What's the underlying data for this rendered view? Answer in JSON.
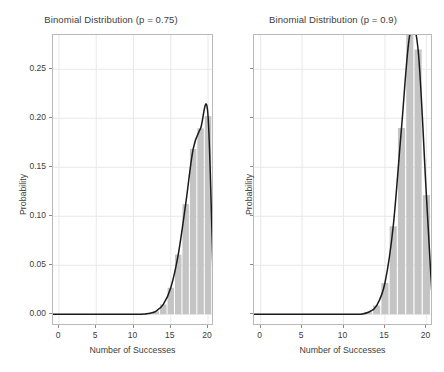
{
  "figure": {
    "width": 444,
    "height": 372,
    "background": "#ffffff",
    "bar_color": "#c4c4c4",
    "curve_color": "#1a1a1a",
    "grid_color": "#e8e8e8",
    "axis_color": "#b9b9b9",
    "text_color": "#3c3c3c"
  },
  "chart_data": [
    {
      "type": "bar",
      "title": "Binomial Distribution (p = 0.75)",
      "xlabel": "Number of Successes",
      "ylabel": "Probability",
      "xlim": [
        -0.8,
        20.8
      ],
      "ylim": [
        -0.012,
        0.285
      ],
      "grid": true,
      "legend": "none",
      "xticks": [
        0,
        5,
        10,
        15,
        20
      ],
      "xtick_labels": [
        "0",
        "5",
        "10",
        "15",
        "20"
      ],
      "yticks": [
        0.0,
        0.05,
        0.1,
        0.15,
        0.2,
        0.25
      ],
      "ytick_labels": [
        "0.00",
        "0.05",
        "0.10",
        "0.15",
        "0.20",
        "0.25"
      ],
      "categories": [
        0,
        1,
        2,
        3,
        4,
        5,
        6,
        7,
        8,
        9,
        10,
        11,
        12,
        13,
        14,
        15,
        16,
        17,
        18,
        19,
        20
      ],
      "values": [
        0.0,
        0.0,
        0.0,
        0.0,
        0.0,
        0.0,
        0.0,
        0.0,
        0.0,
        0.0,
        0.0,
        0.001,
        0.003,
        0.01,
        0.027,
        0.06,
        0.112,
        0.169,
        0.19,
        0.152,
        0.067,
        0.003
      ],
      "series": [
        {
          "name": "binomial pmf (n = 20, p = 0.75)",
          "values": [
            0.0,
            0.0,
            0.0,
            0.0,
            0.0,
            0.0,
            0.0,
            0.0,
            0.0,
            0.0,
            0.0,
            0.0,
            0.0008,
            0.003,
            0.01,
            0.0271,
            0.0609,
            0.1124,
            0.1686,
            0.1897,
            0.2023,
            0.1339,
            0.0317
          ],
          "color": "#c4c4c4",
          "kind": "bars"
        },
        {
          "name": "smoothed density curve",
          "color": "#1a1a1a",
          "kind": "line"
        }
      ],
      "peak": {
        "x": 15,
        "y": 0.2023
      }
    },
    {
      "type": "bar",
      "title": "Binomial Distribution (p = 0.9)",
      "xlabel": "Number of Successes",
      "ylabel": "Probability",
      "xlim": [
        -0.8,
        20.8
      ],
      "ylim": [
        -0.012,
        0.285
      ],
      "grid": true,
      "legend": "none",
      "xticks": [
        0,
        5,
        10,
        15,
        20
      ],
      "xtick_labels": [
        "0",
        "5",
        "10",
        "15",
        "20"
      ],
      "yticks": [
        0.0,
        0.05,
        0.1,
        0.15,
        0.2,
        0.25
      ],
      "ytick_labels": [
        "",
        "",
        "",
        "",
        "",
        ""
      ],
      "categories": [
        0,
        1,
        2,
        3,
        4,
        5,
        6,
        7,
        8,
        9,
        10,
        11,
        12,
        13,
        14,
        15,
        16,
        17,
        18,
        19,
        20
      ],
      "values": [
        0.0,
        0.0,
        0.0,
        0.0,
        0.0,
        0.0,
        0.0,
        0.0,
        0.0,
        0.0,
        0.0,
        0.0,
        0.0,
        0.002,
        0.009,
        0.032,
        0.089,
        0.19,
        0.285,
        0.27,
        0.122,
        0.0
      ],
      "series": [
        {
          "name": "binomial pmf (n = 20, p = 0.9)",
          "values": [
            0.0,
            0.0,
            0.0,
            0.0,
            0.0,
            0.0,
            0.0,
            0.0,
            0.0,
            0.0,
            0.0,
            0.0,
            0.0,
            0.002,
            0.0089,
            0.0319,
            0.0898,
            0.1901,
            0.2852,
            0.2702,
            0.1216,
            0.0
          ],
          "color": "#c4c4c4",
          "kind": "bars"
        },
        {
          "name": "smoothed density curve",
          "color": "#1a1a1a",
          "kind": "line"
        }
      ],
      "peak": {
        "x": 18,
        "y": 0.2852
      }
    }
  ]
}
